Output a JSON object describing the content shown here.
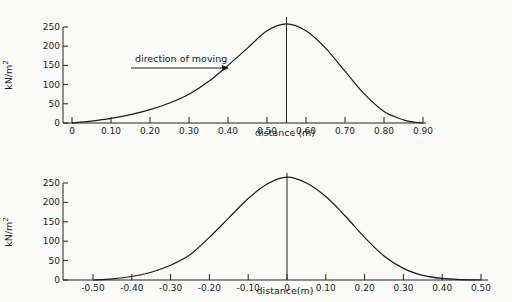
{
  "chart_data": [
    {
      "type": "line",
      "title": "",
      "xlabel": "distance (m)",
      "ylabel": "kN/m2",
      "xlim": [
        0,
        0.92
      ],
      "ylim": [
        0,
        250
      ],
      "x_ticks": [
        "0",
        "0.10",
        "0.20",
        "0.30",
        "0.40",
        "0.50",
        "0.60",
        "0.70",
        "0.80",
        "0.90"
      ],
      "y_ticks": [
        "0",
        "50",
        "100",
        "150",
        "200",
        "250"
      ],
      "annotation": "direction of moving",
      "peak_marker_x": 0.55,
      "grid": false,
      "series": [
        {
          "name": "pressure",
          "x": [
            0,
            0.05,
            0.1,
            0.15,
            0.2,
            0.25,
            0.3,
            0.35,
            0.4,
            0.45,
            0.5,
            0.55,
            0.6,
            0.65,
            0.7,
            0.75,
            0.8,
            0.85,
            0.88,
            0.9
          ],
          "y": [
            0,
            5,
            12,
            22,
            35,
            52,
            75,
            108,
            150,
            195,
            240,
            258,
            240,
            195,
            135,
            75,
            30,
            8,
            2,
            0
          ]
        }
      ]
    },
    {
      "type": "line",
      "title": "",
      "xlabel": "distance(m)",
      "ylabel": "kN/m2",
      "xlim": [
        -0.57,
        0.52
      ],
      "ylim": [
        0,
        250
      ],
      "x_ticks": [
        "-0.50",
        "-0.40",
        "-0.30",
        "-0.20",
        "-0.10",
        "0",
        "0.10",
        "0.20",
        "0.30",
        "0.40",
        "0.50"
      ],
      "y_ticks": [
        "0",
        "50",
        "100",
        "150",
        "200",
        "250"
      ],
      "peak_marker_x": 0,
      "grid": false,
      "series": [
        {
          "name": "pressure",
          "x": [
            -0.5,
            -0.45,
            -0.4,
            -0.35,
            -0.3,
            -0.25,
            -0.2,
            -0.15,
            -0.1,
            -0.05,
            0,
            0.05,
            0.1,
            0.15,
            0.2,
            0.25,
            0.3,
            0.35,
            0.4,
            0.45,
            0.5
          ],
          "y": [
            0,
            3,
            9,
            20,
            38,
            65,
            110,
            160,
            210,
            248,
            265,
            250,
            215,
            165,
            110,
            62,
            30,
            12,
            4,
            1,
            0
          ]
        }
      ]
    }
  ]
}
